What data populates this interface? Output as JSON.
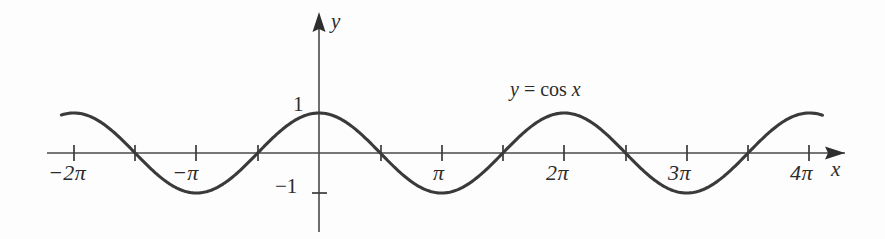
{
  "figure": {
    "title": "",
    "background_color": "#fdfdfd",
    "curve_color": "#3a3a3a",
    "axis_color": "#4a4a4a",
    "text_color": "#2b2b2b",
    "annotation": "y = cos x",
    "annotation_parts": {
      "lhs": "y",
      "equals": "=",
      "rhs_function": "cos",
      "rhs_variable": "x"
    },
    "x_axis_name": "x",
    "y_axis_name": "y",
    "x_tick_labels": [
      "−2π",
      "−π",
      "π",
      "2π",
      "3π",
      "4π"
    ],
    "y_tick_labels": [
      "1",
      "−1"
    ]
  },
  "chart_data": {
    "type": "line",
    "title": "",
    "subtitle": "",
    "xlabel": "x",
    "ylabel": "y",
    "annotations": [
      "y = cos x"
    ],
    "legend": [],
    "legend_position": "none",
    "grid": false,
    "xlim": [
      -7.4,
      13.4
    ],
    "ylim": [
      -1.6,
      2.2
    ],
    "x_ticks": [
      -6.283185,
      -3.141593,
      3.141593,
      6.283185,
      9.424778,
      12.566371
    ],
    "x_tick_labels": [
      "−2π",
      "−π",
      "π",
      "2π",
      "3π",
      "4π"
    ],
    "x_minor_ticks": [
      -4.712389,
      -1.570796,
      1.570796,
      4.712389,
      7.853982,
      10.995574
    ],
    "y_ticks": [
      1,
      -1
    ],
    "y_tick_labels": [
      "1",
      "−1"
    ],
    "series": [
      {
        "name": "y = cos x",
        "expression": "cos(x)",
        "amplitude": 1,
        "period": 6.283185,
        "x_start": -6.6,
        "x_end": 12.9,
        "color": "#3a3a3a",
        "points": [
          {
            "x": -6.283185,
            "y": 1
          },
          {
            "x": -4.712389,
            "y": 0
          },
          {
            "x": -3.141593,
            "y": -1
          },
          {
            "x": -1.570796,
            "y": 0
          },
          {
            "x": 0,
            "y": 1
          },
          {
            "x": 1.570796,
            "y": 0
          },
          {
            "x": 3.141593,
            "y": -1
          },
          {
            "x": 4.712389,
            "y": 0
          },
          {
            "x": 6.283185,
            "y": 1
          },
          {
            "x": 7.853982,
            "y": 0
          },
          {
            "x": 9.424778,
            "y": -1
          },
          {
            "x": 10.995574,
            "y": 0
          },
          {
            "x": 12.566371,
            "y": 1
          }
        ]
      }
    ]
  }
}
